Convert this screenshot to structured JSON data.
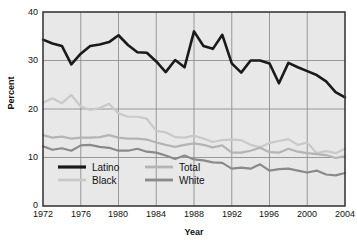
{
  "chart_data": {
    "type": "line",
    "title": "",
    "xlabel": "Year",
    "ylabel": "Percent",
    "xlim": [
      1972,
      2004
    ],
    "ylim": [
      0,
      40
    ],
    "yticks": [
      0,
      10,
      20,
      30,
      40
    ],
    "xticks": [
      1972,
      1976,
      1980,
      1984,
      1988,
      1992,
      1996,
      2000,
      2004
    ],
    "grid": true,
    "legend_position": "lower-left-inside",
    "x": [
      1972,
      1973,
      1974,
      1975,
      1976,
      1977,
      1978,
      1979,
      1980,
      1981,
      1982,
      1983,
      1984,
      1985,
      1986,
      1987,
      1988,
      1989,
      1990,
      1991,
      1992,
      1993,
      1994,
      1995,
      1996,
      1997,
      1998,
      1999,
      2000,
      2001,
      2002,
      2003,
      2004
    ],
    "series": [
      {
        "name": "Latino",
        "color": "#1a1a1a",
        "values": [
          34.3,
          33.5,
          33.0,
          29.2,
          31.4,
          33.0,
          33.3,
          33.8,
          35.2,
          33.2,
          31.7,
          31.6,
          29.8,
          27.6,
          30.1,
          28.6,
          36.0,
          33.0,
          32.4,
          35.3,
          29.4,
          27.5,
          30.0,
          30.0,
          29.4,
          25.3,
          29.5,
          28.6,
          27.8,
          27.0,
          25.7,
          23.5,
          22.4
        ]
      },
      {
        "name": "Black",
        "color": "#c9c9c9",
        "values": [
          21.3,
          22.2,
          21.2,
          22.9,
          20.5,
          19.8,
          20.2,
          21.1,
          19.1,
          18.4,
          18.4,
          18.0,
          15.5,
          15.2,
          14.2,
          14.1,
          14.5,
          13.9,
          13.2,
          13.6,
          13.7,
          13.6,
          12.6,
          12.1,
          13.0,
          13.4,
          13.8,
          12.6,
          13.1,
          10.9,
          11.3,
          10.9,
          11.8
        ]
      },
      {
        "name": "Total",
        "color": "#b4b4b4",
        "values": [
          14.6,
          14.1,
          14.3,
          13.9,
          14.1,
          14.1,
          14.2,
          14.6,
          14.1,
          13.9,
          13.9,
          13.7,
          13.1,
          12.6,
          12.2,
          12.6,
          12.9,
          12.6,
          12.1,
          12.5,
          11.0,
          11.0,
          11.4,
          12.0,
          11.1,
          11.0,
          11.8,
          11.2,
          10.9,
          10.7,
          10.5,
          9.9,
          10.3
        ]
      },
      {
        "name": "White",
        "color": "#8a8a8a",
        "values": [
          12.3,
          11.6,
          11.9,
          11.4,
          12.5,
          12.6,
          12.2,
          12.0,
          11.4,
          11.4,
          11.8,
          11.2,
          11.0,
          10.4,
          9.7,
          10.4,
          9.6,
          9.4,
          9.0,
          8.9,
          7.7,
          7.9,
          7.7,
          8.6,
          7.3,
          7.6,
          7.7,
          7.3,
          6.9,
          7.3,
          6.5,
          6.3,
          6.8
        ]
      }
    ]
  },
  "legend": {
    "items": [
      {
        "label": "Latino",
        "color": "#1a1a1a"
      },
      {
        "label": "Black",
        "color": "#c9c9c9"
      },
      {
        "label": "Total",
        "color": "#b4b4b4"
      },
      {
        "label": "White",
        "color": "#8a8a8a"
      }
    ]
  },
  "axes": {
    "y_title": "Percent",
    "x_title": "Year",
    "y_tick_labels": [
      "0",
      "10",
      "20",
      "30",
      "40"
    ],
    "x_tick_labels": [
      "1972",
      "1976",
      "1980",
      "1984",
      "1988",
      "1992",
      "1996",
      "2000",
      "2004"
    ]
  },
  "style": {
    "panel_background": "#e8e8e8",
    "grid_color": "#8f8f8f",
    "frame_color": "#3a3a3a",
    "text_color": "#111111"
  }
}
